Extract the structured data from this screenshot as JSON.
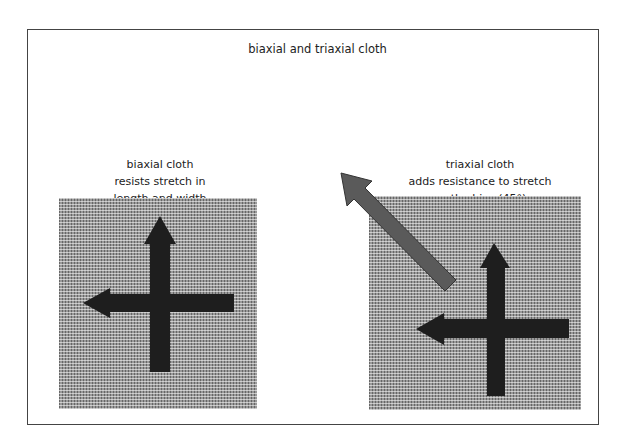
{
  "title": "biaxial and triaxial cloth",
  "panels": [
    {
      "name": "biaxial",
      "caption_lines": [
        "biaxial cloth",
        "resists stretch in",
        "length and width"
      ],
      "arrows": [
        "up",
        "left"
      ]
    },
    {
      "name": "triaxial",
      "caption_lines": [
        "triaxial cloth",
        "adds resistance to stretch",
        "on the bias (45°)"
      ],
      "arrows": [
        "up",
        "left",
        "diagonal-up-left"
      ]
    }
  ],
  "colors": {
    "arrow_dark": "#1e1e1e",
    "arrow_bias": "#5a5a5a",
    "cloth": "#9a9a9a",
    "frame": "#444444"
  }
}
